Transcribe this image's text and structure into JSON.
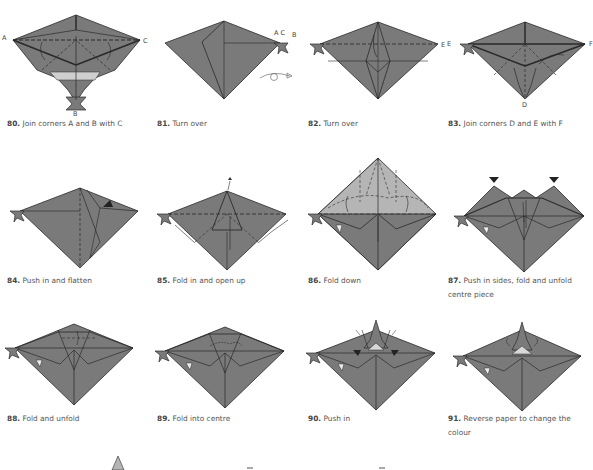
{
  "page": {
    "paper_color": "#7a7a7a",
    "paper_light_color": "#b5b5b5",
    "line_color": "#2a2a2a"
  },
  "steps": [
    {
      "number": "80.",
      "text": "Join corners A and B with C",
      "labels": [
        "A",
        "B",
        "C"
      ]
    },
    {
      "number": "81.",
      "text": "Turn over",
      "labels": [
        "A C",
        "B"
      ]
    },
    {
      "number": "82.",
      "text": "Turn over",
      "labels": [
        "E"
      ]
    },
    {
      "number": "83.",
      "text": "Join corners D and E with F",
      "labels": [
        "E",
        "F",
        "D"
      ]
    },
    {
      "number": "84.",
      "text": "Push in and flatten",
      "labels": []
    },
    {
      "number": "85.",
      "text": "Fold in and open up",
      "labels": []
    },
    {
      "number": "86.",
      "text": "Fold down",
      "labels": []
    },
    {
      "number": "87.",
      "text": "Push in sides, fold and unfold centre piece",
      "labels": []
    },
    {
      "number": "88.",
      "text": "Fold and unfold",
      "labels": []
    },
    {
      "number": "89.",
      "text": "Fold into centre",
      "labels": []
    },
    {
      "number": "90.",
      "text": "Push in",
      "labels": []
    },
    {
      "number": "91.",
      "text": "Reverse paper to change the colour",
      "labels": []
    }
  ]
}
